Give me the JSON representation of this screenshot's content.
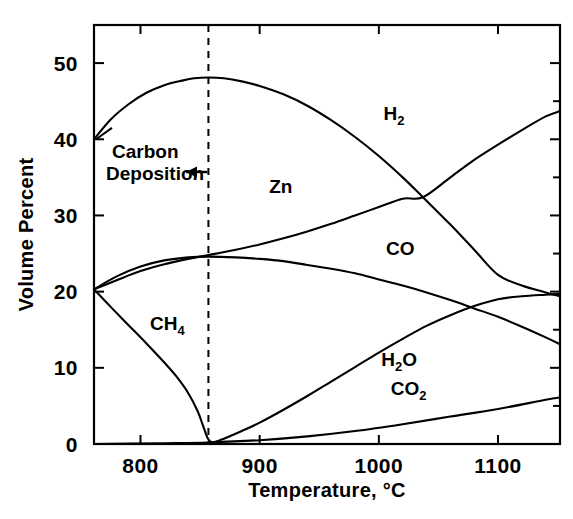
{
  "chart_data": {
    "type": "line",
    "title": "",
    "xlabel": "Temperature, °C",
    "ylabel": "Volume Percent",
    "xlim": [
      761,
      1152
    ],
    "ylim": [
      0,
      55
    ],
    "xticks": [
      800,
      900,
      1000,
      1100
    ],
    "xtick_labels": [
      "800",
      "900",
      "1000",
      "1100"
    ],
    "yticks": [
      0,
      10,
      20,
      30,
      40,
      50
    ],
    "ytick_labels": [
      "0",
      "10",
      "20",
      "30",
      "40",
      "50"
    ],
    "grid": false,
    "legend_position": "inline-labels",
    "annotations": [
      {
        "name": "carbon-deposition",
        "text_line1": "Carbon",
        "text_line2": "Deposition",
        "arrow_points_to_x": 857,
        "arrow_direction": "left",
        "note": "vertical dashed boundary at 857 C"
      }
    ],
    "vertical_reference_line": {
      "x": 857,
      "style": "dashed"
    },
    "series": [
      {
        "name": "H2",
        "label": "H",
        "label_sub": "2",
        "label_x": 1004,
        "label_y": 42.5,
        "points": [
          [
            761,
            40.0
          ],
          [
            775,
            42.6
          ],
          [
            790,
            44.6
          ],
          [
            805,
            46.1
          ],
          [
            820,
            47.1
          ],
          [
            835,
            47.7
          ],
          [
            845,
            48.0
          ],
          [
            857,
            48.1
          ],
          [
            870,
            48.0
          ],
          [
            885,
            47.6
          ],
          [
            900,
            47.0
          ],
          [
            920,
            45.9
          ],
          [
            940,
            44.4
          ],
          [
            960,
            42.5
          ],
          [
            980,
            40.3
          ],
          [
            1000,
            37.8
          ],
          [
            1020,
            35.0
          ],
          [
            1037,
            32.4
          ],
          [
            1060,
            28.8
          ],
          [
            1080,
            25.5
          ],
          [
            1100,
            22.2
          ],
          [
            1120,
            20.8
          ],
          [
            1140,
            19.9
          ],
          [
            1152,
            19.4
          ]
        ]
      },
      {
        "name": "Zn",
        "label": "Zn",
        "label_sub": "",
        "label_x": 908,
        "label_y": 33.0,
        "points": [
          [
            761,
            20.3
          ],
          [
            780,
            21.5
          ],
          [
            800,
            22.7
          ],
          [
            820,
            23.6
          ],
          [
            840,
            24.3
          ],
          [
            857,
            24.8
          ],
          [
            880,
            25.5
          ],
          [
            900,
            26.2
          ],
          [
            920,
            27.0
          ],
          [
            940,
            27.9
          ],
          [
            960,
            28.9
          ],
          [
            980,
            30.0
          ],
          [
            1000,
            31.1
          ],
          [
            1020,
            32.2
          ],
          [
            1037,
            32.4
          ],
          [
            1060,
            35.0
          ],
          [
            1080,
            37.3
          ],
          [
            1100,
            39.3
          ],
          [
            1120,
            41.2
          ],
          [
            1140,
            43.0
          ],
          [
            1152,
            43.7
          ]
        ]
      },
      {
        "name": "CO",
        "label": "CO",
        "label_sub": "",
        "label_x": 1006,
        "label_y": 24.8,
        "points": [
          [
            761,
            20.3
          ],
          [
            780,
            22.0
          ],
          [
            800,
            23.3
          ],
          [
            820,
            24.1
          ],
          [
            840,
            24.5
          ],
          [
            857,
            24.6
          ],
          [
            880,
            24.5
          ],
          [
            900,
            24.3
          ],
          [
            920,
            24.0
          ],
          [
            940,
            23.5
          ],
          [
            960,
            23.0
          ],
          [
            980,
            22.4
          ],
          [
            1000,
            21.6
          ],
          [
            1020,
            20.8
          ],
          [
            1040,
            19.9
          ],
          [
            1060,
            18.9
          ],
          [
            1080,
            17.8
          ],
          [
            1100,
            16.7
          ],
          [
            1120,
            15.4
          ],
          [
            1140,
            14.0
          ],
          [
            1152,
            13.1
          ]
        ]
      },
      {
        "name": "CH4",
        "label": "CH",
        "label_sub": "4",
        "label_x": 808,
        "label_y": 15.0,
        "points": [
          [
            761,
            20.3
          ],
          [
            775,
            18.0
          ],
          [
            790,
            15.6
          ],
          [
            805,
            13.2
          ],
          [
            820,
            10.7
          ],
          [
            830,
            8.9
          ],
          [
            840,
            6.7
          ],
          [
            848,
            4.3
          ],
          [
            852,
            2.6
          ],
          [
            855,
            1.3
          ],
          [
            857,
            0.6
          ],
          [
            860,
            0.2
          ],
          [
            865,
            0.05
          ],
          [
            880,
            0.0
          ]
        ]
      },
      {
        "name": "H2O",
        "label": "H",
        "label_sub": "2",
        "label_suffix": "O",
        "label_x": 1002,
        "label_y": 10.3,
        "points": [
          [
            857,
            0.0
          ],
          [
            870,
            0.7
          ],
          [
            885,
            1.7
          ],
          [
            900,
            2.8
          ],
          [
            920,
            4.5
          ],
          [
            940,
            6.3
          ],
          [
            960,
            8.2
          ],
          [
            980,
            10.1
          ],
          [
            1000,
            12.0
          ],
          [
            1020,
            13.8
          ],
          [
            1040,
            15.5
          ],
          [
            1060,
            16.9
          ],
          [
            1080,
            18.1
          ],
          [
            1100,
            19.0
          ],
          [
            1120,
            19.4
          ],
          [
            1140,
            19.6
          ],
          [
            1152,
            19.7
          ]
        ]
      },
      {
        "name": "CO2",
        "label": "CO",
        "label_sub": "2",
        "label_x": 1010,
        "label_y": 6.4,
        "points": [
          [
            761,
            0.0
          ],
          [
            820,
            0.1
          ],
          [
            857,
            0.2
          ],
          [
            900,
            0.5
          ],
          [
            940,
            1.0
          ],
          [
            980,
            1.7
          ],
          [
            1020,
            2.6
          ],
          [
            1060,
            3.6
          ],
          [
            1100,
            4.6
          ],
          [
            1140,
            5.8
          ],
          [
            1152,
            6.1
          ]
        ]
      }
    ]
  }
}
